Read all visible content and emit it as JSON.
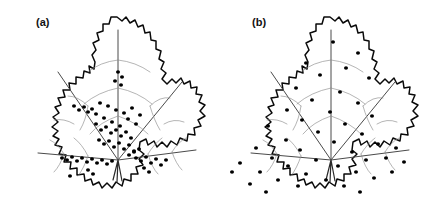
{
  "figure": {
    "background_color": "#ffffff",
    "panel_count": 2,
    "dot_color": "#000000",
    "outline_color": "#0a0a0a",
    "vein_color": "#8c8c8c"
  },
  "panels": [
    {
      "id": "a",
      "label": "(a)",
      "distribution": "aggregated at leaf base and along proximal veins",
      "dot_count": 63
    },
    {
      "id": "b",
      "label": "(b)",
      "distribution": "uniformly dispersed across entire leaf blade",
      "dot_count": 46
    }
  ],
  "chart_data": {
    "type": "scatter",
    "title": "",
    "xlabel": "",
    "ylabel": "",
    "series": [
      {
        "name": "(a) aggregated",
        "points": [
          [
            118,
            72
          ],
          [
            122,
            77
          ],
          [
            115,
            81
          ],
          [
            121,
            85
          ],
          [
            74,
            106
          ],
          [
            79,
            110
          ],
          [
            84,
            107
          ],
          [
            88,
            112
          ],
          [
            92,
            109
          ],
          [
            96,
            114
          ],
          [
            100,
            103
          ],
          [
            104,
            118
          ],
          [
            108,
            106
          ],
          [
            112,
            122
          ],
          [
            116,
            110
          ],
          [
            120,
            126
          ],
          [
            124,
            113
          ],
          [
            128,
            119
          ],
          [
            132,
            108
          ],
          [
            136,
            124
          ],
          [
            140,
            115
          ],
          [
            96,
            124
          ],
          [
            101,
            130
          ],
          [
            106,
            127
          ],
          [
            111,
            133
          ],
          [
            116,
            130
          ],
          [
            121,
            136
          ],
          [
            126,
            132
          ],
          [
            131,
            138
          ],
          [
            99,
            140
          ],
          [
            104,
            144
          ],
          [
            109,
            141
          ],
          [
            114,
            147
          ],
          [
            119,
            143
          ],
          [
            124,
            149
          ],
          [
            129,
            145
          ],
          [
            134,
            151
          ],
          [
            62,
            158
          ],
          [
            67,
            160
          ],
          [
            72,
            157
          ],
          [
            77,
            161
          ],
          [
            82,
            158
          ],
          [
            87,
            162
          ],
          [
            92,
            159
          ],
          [
            97,
            163
          ],
          [
            102,
            160
          ],
          [
            107,
            164
          ],
          [
            112,
            161
          ],
          [
            136,
            158
          ],
          [
            141,
            161
          ],
          [
            146,
            157
          ],
          [
            151,
            163
          ],
          [
            156,
            159
          ],
          [
            161,
            165
          ],
          [
            166,
            160
          ],
          [
            129,
            155
          ],
          [
            134,
            152
          ],
          [
            139,
            149
          ],
          [
            88,
            170
          ],
          [
            93,
            174
          ],
          [
            70,
            176
          ],
          [
            144,
            168
          ],
          [
            149,
            172
          ]
        ]
      },
      {
        "name": "(b) uniform",
        "points": [
          [
            333,
            42
          ],
          [
            358,
            53
          ],
          [
            306,
            63
          ],
          [
            346,
            68
          ],
          [
            320,
            75
          ],
          [
            369,
            78
          ],
          [
            296,
            88
          ],
          [
            340,
            92
          ],
          [
            312,
            100
          ],
          [
            358,
            103
          ],
          [
            287,
            110
          ],
          [
            330,
            112
          ],
          [
            372,
            116
          ],
          [
            302,
            120
          ],
          [
            345,
            124
          ],
          [
            268,
            126
          ],
          [
            318,
            132
          ],
          [
            362,
            134
          ],
          [
            286,
            140
          ],
          [
            334,
            142
          ],
          [
            378,
            144
          ],
          [
            256,
            148
          ],
          [
            300,
            150
          ],
          [
            352,
            152
          ],
          [
            272,
            158
          ],
          [
            316,
            160
          ],
          [
            366,
            160
          ],
          [
            240,
            163
          ],
          [
            288,
            166
          ],
          [
            338,
            166
          ],
          [
            386,
            158
          ],
          [
            260,
            172
          ],
          [
            306,
            174
          ],
          [
            356,
            172
          ],
          [
            396,
            148
          ],
          [
            278,
            180
          ],
          [
            326,
            180
          ],
          [
            374,
            178
          ],
          [
            250,
            184
          ],
          [
            298,
            186
          ],
          [
            344,
            186
          ],
          [
            392,
            172
          ],
          [
            232,
            172
          ],
          [
            404,
            162
          ],
          [
            266,
            192
          ],
          [
            360,
            192
          ]
        ]
      }
    ]
  }
}
